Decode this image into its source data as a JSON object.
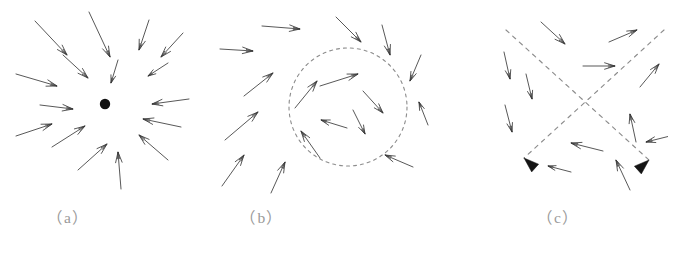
{
  "figure": {
    "background_color": "#ffffff",
    "arrow_color": "#3a3a3a",
    "dashed_color": "#8c8c8c",
    "caption_color": "#9a9a9a",
    "fixed_point_color": "#111111",
    "width": 684,
    "height": 257
  },
  "panels": [
    {
      "id": "a",
      "caption": "（a）",
      "kind": "stable-node-sink",
      "description": "Arrows converge inward toward a single filled fixed point",
      "fixed_point": {
        "cx": 105,
        "cy": 104,
        "r": 5.2
      },
      "arrows": [
        {
          "x1": 35,
          "y1": 21,
          "x2": 67,
          "y2": 55
        },
        {
          "x1": 89,
          "y1": 12,
          "x2": 110,
          "y2": 57
        },
        {
          "x1": 149,
          "y1": 20,
          "x2": 139,
          "y2": 50
        },
        {
          "x1": 183,
          "y1": 33,
          "x2": 161,
          "y2": 57
        },
        {
          "x1": 16,
          "y1": 74,
          "x2": 57,
          "y2": 86
        },
        {
          "x1": 63,
          "y1": 55,
          "x2": 88,
          "y2": 78
        },
        {
          "x1": 118,
          "y1": 60,
          "x2": 111,
          "y2": 83
        },
        {
          "x1": 168,
          "y1": 63,
          "x2": 148,
          "y2": 76
        },
        {
          "x1": 40,
          "y1": 105,
          "x2": 73,
          "y2": 109
        },
        {
          "x1": 189,
          "y1": 99,
          "x2": 152,
          "y2": 104
        },
        {
          "x1": 16,
          "y1": 136,
          "x2": 52,
          "y2": 124
        },
        {
          "x1": 181,
          "y1": 127,
          "x2": 143,
          "y2": 119
        },
        {
          "x1": 52,
          "y1": 147,
          "x2": 85,
          "y2": 126
        },
        {
          "x1": 168,
          "y1": 160,
          "x2": 139,
          "y2": 135
        },
        {
          "x1": 78,
          "y1": 170,
          "x2": 107,
          "y2": 144
        },
        {
          "x1": 121,
          "y1": 189,
          "x2": 118,
          "y2": 152
        }
      ]
    },
    {
      "id": "b",
      "caption": "（b）",
      "kind": "unstable-limit-cycle",
      "description": "Dashed circular limit cycle with arrows pointing outward on both sides",
      "cycle": {
        "cx": 132,
        "cy": 107,
        "r": 59,
        "dash": "3 4"
      },
      "arrows": [
        {
          "x1": 46,
          "y1": 26,
          "x2": 84,
          "y2": 29
        },
        {
          "x1": 120,
          "y1": 17,
          "x2": 145,
          "y2": 42
        },
        {
          "x1": 166,
          "y1": 25,
          "x2": 174,
          "y2": 55
        },
        {
          "x1": 4,
          "y1": 49,
          "x2": 37,
          "y2": 51
        },
        {
          "x1": 205,
          "y1": 55,
          "x2": 194,
          "y2": 81
        },
        {
          "x1": 28,
          "y1": 96,
          "x2": 57,
          "y2": 73
        },
        {
          "x1": 9,
          "y1": 140,
          "x2": 42,
          "y2": 112
        },
        {
          "x1": 212,
          "y1": 125,
          "x2": 203,
          "y2": 102
        },
        {
          "x1": 6,
          "y1": 186,
          "x2": 28,
          "y2": 155
        },
        {
          "x1": 55,
          "y1": 193,
          "x2": 69,
          "y2": 162
        },
        {
          "x1": 197,
          "y1": 167,
          "x2": 169,
          "y2": 155
        },
        {
          "x1": 104,
          "y1": 86,
          "x2": 142,
          "y2": 74
        },
        {
          "x1": 79,
          "y1": 108,
          "x2": 101,
          "y2": 81
        },
        {
          "x1": 147,
          "y1": 91,
          "x2": 167,
          "y2": 113
        },
        {
          "x1": 131,
          "y1": 128,
          "x2": 105,
          "y2": 120
        },
        {
          "x1": 137,
          "y1": 110,
          "x2": 149,
          "y2": 134
        },
        {
          "x1": 104,
          "y1": 158,
          "x2": 85,
          "y2": 131
        }
      ]
    },
    {
      "id": "c",
      "caption": "（c）",
      "kind": "saddle-point",
      "description": "Two dashed separatrix lines crossing in an X with solid arrowheads on the lower branches",
      "separatrices": [
        {
          "x1": 66,
          "y1": 30,
          "x2": 209,
          "y2": 160,
          "dash": "4 5"
        },
        {
          "x1": 224,
          "y1": 30,
          "x2": 84,
          "y2": 158,
          "dash": "4 5"
        }
      ],
      "solid_arrowheads": [
        {
          "cx": 84,
          "cy": 158,
          "angle": 222
        },
        {
          "cx": 209,
          "cy": 160,
          "angle": 318
        }
      ],
      "crossing_point": {
        "cx": 153,
        "cy": 103
      },
      "arrows": [
        {
          "x1": 101,
          "y1": 22,
          "x2": 125,
          "y2": 44
        },
        {
          "x1": 169,
          "y1": 42,
          "x2": 197,
          "y2": 30
        },
        {
          "x1": 64,
          "y1": 52,
          "x2": 70,
          "y2": 79
        },
        {
          "x1": 143,
          "y1": 66,
          "x2": 175,
          "y2": 66
        },
        {
          "x1": 200,
          "y1": 87,
          "x2": 219,
          "y2": 64
        },
        {
          "x1": 86,
          "y1": 74,
          "x2": 92,
          "y2": 99
        },
        {
          "x1": 65,
          "y1": 105,
          "x2": 72,
          "y2": 132
        },
        {
          "x1": 196,
          "y1": 142,
          "x2": 190,
          "y2": 114
        },
        {
          "x1": 234,
          "y1": 135,
          "x2": 206,
          "y2": 142
        },
        {
          "x1": 163,
          "y1": 151,
          "x2": 131,
          "y2": 143
        },
        {
          "x1": 131,
          "y1": 172,
          "x2": 108,
          "y2": 166
        },
        {
          "x1": 190,
          "y1": 190,
          "x2": 176,
          "y2": 160
        }
      ]
    }
  ]
}
